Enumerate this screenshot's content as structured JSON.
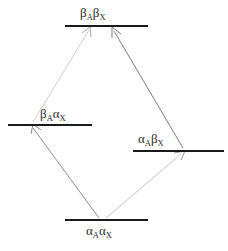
{
  "diagram": {
    "name": "nmr-spin-state-energy-level-diagram",
    "background_color": "#ffffff",
    "width": 228,
    "height": 251,
    "level_color": "#1a1a1a",
    "levels": [
      {
        "id": "beta-a-beta-x",
        "label_html": "β<sub>A</sub>β<sub>X</sub>",
        "label_text": "βAβX",
        "position": "top",
        "line": {
          "x1": 65,
          "x2": 148,
          "y": 26
        },
        "label_xy": {
          "x": 80,
          "y": 6
        }
      },
      {
        "id": "beta-a-alpha-x",
        "label_html": "β<sub>A</sub>α<sub>X</sub>",
        "label_text": "βAαX",
        "position": "middle-left",
        "line": {
          "x1": 8,
          "x2": 92,
          "y": 125
        },
        "label_xy": {
          "x": 40,
          "y": 107
        }
      },
      {
        "id": "alpha-a-beta-x",
        "label_html": "α<sub>A</sub>β<sub>X</sub>",
        "label_text": "αAβX",
        "position": "middle-right",
        "line": {
          "x1": 133,
          "x2": 224,
          "y": 151
        },
        "label_xy": {
          "x": 138,
          "y": 132
        }
      },
      {
        "id": "alpha-a-alpha-x",
        "label_html": "α<sub>A</sub>α<sub>X</sub>",
        "label_text": "αAαX",
        "position": "bottom",
        "line": {
          "x1": 65,
          "x2": 148,
          "y": 220
        },
        "label_xy": {
          "x": 86,
          "y": 224
        }
      }
    ],
    "transitions": [
      {
        "id": "transition-aa-to-ba",
        "from": "alpha-a-alpha-x",
        "to": "beta-a-alpha-x",
        "color": "#8c8c8c",
        "x1": 99,
        "y1": 218,
        "x2": 33,
        "y2": 128
      },
      {
        "id": "transition-aa-to-ab",
        "from": "alpha-a-alpha-x",
        "to": "alpha-a-beta-x",
        "color": "#c4c4c4",
        "x1": 106,
        "y1": 218,
        "x2": 181,
        "y2": 154
      },
      {
        "id": "transition-ba-to-bb",
        "from": "beta-a-alpha-x",
        "to": "beta-a-beta-x",
        "color": "#cfcfcf",
        "x1": 33,
        "y1": 122,
        "x2": 89,
        "y2": 30
      },
      {
        "id": "transition-ab-to-bb",
        "from": "alpha-a-beta-x",
        "to": "beta-a-beta-x",
        "color": "#7d7d7d",
        "x1": 183,
        "y1": 148,
        "x2": 114,
        "y2": 30
      }
    ]
  }
}
